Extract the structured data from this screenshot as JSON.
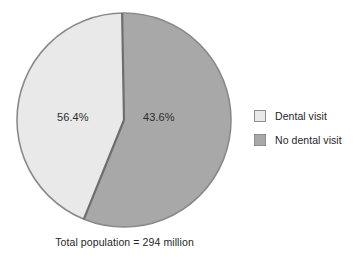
{
  "chart_data": {
    "type": "pie",
    "title": "",
    "subtitle": "",
    "xlabel": "",
    "ylabel": "",
    "grid": false,
    "legend_position": "right",
    "caption": "Total population = 294 million",
    "start_angle_deg": -1,
    "direction": "counterclockwise",
    "categories": [
      "Dental visit",
      "No dental visit"
    ],
    "values": [
      43.6,
      56.4
    ],
    "value_unit": "percent",
    "data_labels": [
      "43.6%",
      "56.4%"
    ],
    "colors": [
      "#e9e9e9",
      "#a8a8a8"
    ],
    "slice_border_color": "#6e6e6e",
    "slices": [
      {
        "name": "Dental visit",
        "value": 43.6,
        "label": "43.6%",
        "color": "#e9e9e9"
      },
      {
        "name": "No dental visit",
        "value": 56.4,
        "label": "56.4%",
        "color": "#a8a8a8"
      }
    ]
  },
  "pie": {
    "labels": {
      "no_dental_visit": "56.4%",
      "dental_visit": "43.6%"
    }
  },
  "legend": {
    "items": [
      {
        "label": "Dental visit",
        "color": "#e9e9e9",
        "swatch": "legend-swatch-light"
      },
      {
        "label": "No dental visit",
        "color": "#a8a8a8",
        "swatch": "legend-swatch-dark"
      }
    ]
  },
  "caption": {
    "text": "Total population = 294 million"
  }
}
